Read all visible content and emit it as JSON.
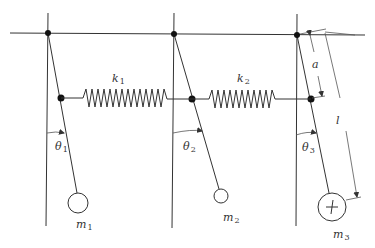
{
  "diagram": {
    "labels": {
      "spring1": {
        "sym": "k",
        "sub": "1"
      },
      "spring2": {
        "sym": "k",
        "sub": "2"
      },
      "theta1": {
        "sym": "θ",
        "sub": "1"
      },
      "theta2": {
        "sym": "θ",
        "sub": "2"
      },
      "theta3": {
        "sym": "θ",
        "sub": "3"
      },
      "mass1": {
        "sym": "m",
        "sub": "1"
      },
      "mass2": {
        "sym": "m",
        "sub": "2"
      },
      "mass3": {
        "sym": "m",
        "sub": "3"
      },
      "dim_a": "a",
      "dim_l": "l"
    },
    "colors": {
      "line": "#333333",
      "background": "#ffffff"
    }
  }
}
